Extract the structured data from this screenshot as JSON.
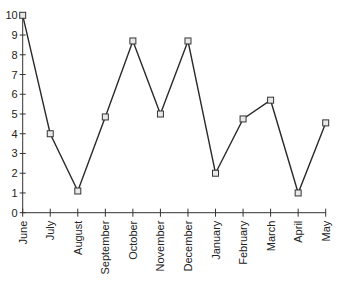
{
  "chart_data": {
    "type": "line",
    "title": "",
    "xlabel": "",
    "ylabel": "",
    "categories": [
      "June",
      "July",
      "August",
      "September",
      "October",
      "November",
      "December",
      "January",
      "February",
      "March",
      "April",
      "May"
    ],
    "series": [
      {
        "name": "Series 1",
        "values": [
          10,
          4,
          1.1,
          4.85,
          8.7,
          5,
          8.7,
          2,
          4.75,
          5.7,
          1,
          4.55
        ],
        "marker": "square",
        "color": "#2a2a2a"
      }
    ],
    "ylim": [
      0,
      10
    ],
    "yticks": [
      0,
      1,
      2,
      3,
      4,
      5,
      6,
      7,
      8,
      9,
      10
    ],
    "grid": false,
    "legend": "none",
    "x_tick_label_rotation": -90
  },
  "layout": {
    "plot_left": 22.7,
    "plot_right": 325.7,
    "y_zero": 212.7,
    "y_top": 15.3
  }
}
